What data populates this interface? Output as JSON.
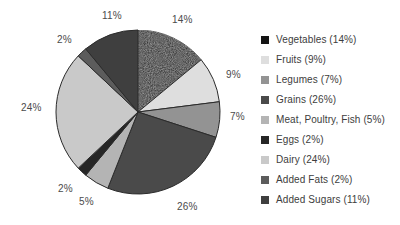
{
  "chart_data": {
    "type": "pie",
    "title": "",
    "labels": [
      "Vegetables",
      "Fruits",
      "Legumes",
      "Grains",
      "Meat, Poultry, Fish",
      "Eggs",
      "Dairy",
      "Added Fats",
      "Added Sugars"
    ],
    "values": [
      14,
      9,
      7,
      26,
      5,
      2,
      24,
      2,
      11
    ],
    "value_unit": "%",
    "slice_labels": [
      "14%",
      "9%",
      "7%",
      "26%",
      "5%",
      "2%",
      "24%",
      "2%",
      "11%"
    ],
    "legend_entries": [
      {
        "label": "Vegetables (14%)",
        "color": "#141414"
      },
      {
        "label": "Fruits (9%)",
        "color": "#dedede"
      },
      {
        "label": "Legumes (7%)",
        "color": "#939393"
      },
      {
        "label": "Grains (26%)",
        "color": "#4a4a4a"
      },
      {
        "label": "Meat, Poultry, Fish (5%)",
        "color": "#b4b4b4"
      },
      {
        "label": "Eggs (2%)",
        "color": "#262626"
      },
      {
        "label": "Dairy (24%)",
        "color": "#c9c9c9"
      },
      {
        "label": "Added Fats (2%)",
        "color": "#5c5c5c"
      },
      {
        "label": "Added Sugars (11%)",
        "color": "#3f3f3f"
      }
    ],
    "legend_position": "right",
    "start_angle_deg": 0,
    "direction": "clockwise",
    "grid": false,
    "xlabel": "",
    "ylabel": ""
  },
  "pie_geometry": {
    "center_x": 138,
    "center_y": 112,
    "radius": 82,
    "outline_color": "#2b2b2b"
  },
  "slice_label_positions": [
    {
      "text": "14%",
      "left": 172,
      "top": 15
    },
    {
      "text": "9%",
      "left": 226,
      "top": 70
    },
    {
      "text": "7%",
      "left": 230,
      "top": 112
    },
    {
      "text": "26%",
      "left": 177,
      "top": 202
    },
    {
      "text": "5%",
      "left": 79,
      "top": 197
    },
    {
      "text": "2%",
      "left": 58,
      "top": 184
    },
    {
      "text": "24%",
      "left": 21,
      "top": 103
    },
    {
      "text": "2%",
      "left": 57,
      "top": 35
    },
    {
      "text": "11%",
      "left": 102,
      "top": 11
    }
  ]
}
